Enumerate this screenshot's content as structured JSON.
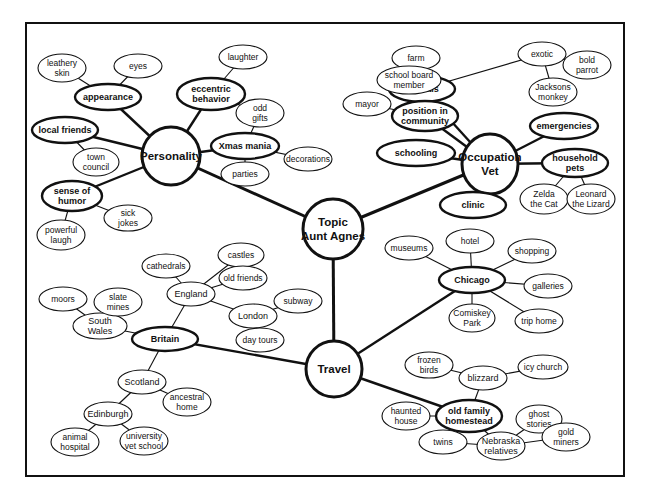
{
  "diagram": {
    "type": "mind-map",
    "center": {
      "id": "topic",
      "label": [
        "Topic",
        "Aunt Agnes"
      ]
    },
    "nodes": [
      {
        "id": "topic",
        "label": [
          "Topic",
          "Aunt Agnes"
        ],
        "level": "main"
      },
      {
        "id": "personality",
        "label": [
          "Personality"
        ],
        "level": "main"
      },
      {
        "id": "occupation",
        "label": [
          "Occupation",
          "Vet"
        ],
        "level": "main"
      },
      {
        "id": "travel",
        "label": [
          "Travel"
        ],
        "level": "main"
      },
      {
        "id": "appearance",
        "label": [
          "appearance"
        ],
        "level": "branch"
      },
      {
        "id": "leathery-skin",
        "label": [
          "leathery",
          "skin"
        ],
        "level": "leaf"
      },
      {
        "id": "eyes",
        "label": [
          "eyes"
        ],
        "level": "leaf"
      },
      {
        "id": "eccentric-behavior",
        "label": [
          "eccentric",
          "behavior"
        ],
        "level": "branch"
      },
      {
        "id": "laughter",
        "label": [
          "laughter"
        ],
        "level": "leaf"
      },
      {
        "id": "odd-gifts",
        "label": [
          "odd",
          "gifts"
        ],
        "level": "leaf"
      },
      {
        "id": "xmas-mania",
        "label": [
          "Xmas mania"
        ],
        "level": "branch"
      },
      {
        "id": "decorations",
        "label": [
          "decorations"
        ],
        "level": "leaf"
      },
      {
        "id": "parties",
        "label": [
          "parties"
        ],
        "level": "leaf"
      },
      {
        "id": "local-friends",
        "label": [
          "local friends"
        ],
        "level": "branch"
      },
      {
        "id": "town-council",
        "label": [
          "town",
          "council"
        ],
        "level": "leaf"
      },
      {
        "id": "sense-of-humor",
        "label": [
          "sense of",
          "humor"
        ],
        "level": "branch"
      },
      {
        "id": "sick-jokes",
        "label": [
          "sick",
          "jokes"
        ],
        "level": "leaf"
      },
      {
        "id": "powerful-laugh",
        "label": [
          "powerful",
          "laugh"
        ],
        "level": "leaf"
      },
      {
        "id": "animals",
        "label": [
          "animals"
        ],
        "level": "branch"
      },
      {
        "id": "farm",
        "label": [
          "farm"
        ],
        "level": "leaf"
      },
      {
        "id": "exotic",
        "label": [
          "exotic"
        ],
        "level": "leaf"
      },
      {
        "id": "bold-parrot",
        "label": [
          "bold",
          "parrot"
        ],
        "level": "leaf"
      },
      {
        "id": "jacksons-monkey",
        "label": [
          "Jacksons",
          "monkey"
        ],
        "level": "leaf"
      },
      {
        "id": "position-in-community",
        "label": [
          "position in",
          "community"
        ],
        "level": "branch"
      },
      {
        "id": "school-board-member",
        "label": [
          "school board",
          "member"
        ],
        "level": "leaf"
      },
      {
        "id": "mayor",
        "label": [
          "mayor"
        ],
        "level": "leaf"
      },
      {
        "id": "emergencies",
        "label": [
          "emergencies"
        ],
        "level": "branch"
      },
      {
        "id": "schooling",
        "label": [
          "schooling"
        ],
        "level": "branch"
      },
      {
        "id": "household-pets",
        "label": [
          "household",
          "pets"
        ],
        "level": "branch"
      },
      {
        "id": "zelda-the-cat",
        "label": [
          "Zelda",
          "the Cat"
        ],
        "level": "leaf"
      },
      {
        "id": "leonard-the-lizard",
        "label": [
          "Leonard",
          "the Lizard"
        ],
        "level": "leaf"
      },
      {
        "id": "clinic",
        "label": [
          "clinic"
        ],
        "level": "branch"
      },
      {
        "id": "chicago",
        "label": [
          "Chicago"
        ],
        "level": "branch"
      },
      {
        "id": "museums",
        "label": [
          "museums"
        ],
        "level": "leaf"
      },
      {
        "id": "hotel",
        "label": [
          "hotel"
        ],
        "level": "leaf"
      },
      {
        "id": "shopping",
        "label": [
          "shopping"
        ],
        "level": "leaf"
      },
      {
        "id": "galleries",
        "label": [
          "galleries"
        ],
        "level": "leaf"
      },
      {
        "id": "comiskey-park",
        "label": [
          "Comiskey",
          "Park"
        ],
        "level": "leaf"
      },
      {
        "id": "trip-home",
        "label": [
          "trip home"
        ],
        "level": "leaf"
      },
      {
        "id": "britain",
        "label": [
          "Britain"
        ],
        "level": "branch"
      },
      {
        "id": "england",
        "label": [
          "England"
        ],
        "level": "sub"
      },
      {
        "id": "cathedrals",
        "label": [
          "cathedrals"
        ],
        "level": "leaf"
      },
      {
        "id": "castles",
        "label": [
          "castles"
        ],
        "level": "leaf"
      },
      {
        "id": "old-friends",
        "label": [
          "old friends"
        ],
        "level": "leaf"
      },
      {
        "id": "london",
        "label": [
          "London"
        ],
        "level": "sub"
      },
      {
        "id": "subway",
        "label": [
          "subway"
        ],
        "level": "leaf"
      },
      {
        "id": "day-tours",
        "label": [
          "day tours"
        ],
        "level": "leaf"
      },
      {
        "id": "south-wales",
        "label": [
          "South",
          "Wales"
        ],
        "level": "sub"
      },
      {
        "id": "moors",
        "label": [
          "moors"
        ],
        "level": "leaf"
      },
      {
        "id": "slate-mines",
        "label": [
          "slate",
          "mines"
        ],
        "level": "leaf"
      },
      {
        "id": "scotland",
        "label": [
          "Scotland"
        ],
        "level": "sub"
      },
      {
        "id": "ancestral-home",
        "label": [
          "ancestral",
          "home"
        ],
        "level": "leaf"
      },
      {
        "id": "edinburgh",
        "label": [
          "Edinburgh"
        ],
        "level": "sub"
      },
      {
        "id": "animal-hospital",
        "label": [
          "animal",
          "hospital"
        ],
        "level": "leaf"
      },
      {
        "id": "university-vet-school",
        "label": [
          "university",
          "vet school"
        ],
        "level": "leaf"
      },
      {
        "id": "old-family-homestead",
        "label": [
          "old family",
          "homestead"
        ],
        "level": "branch"
      },
      {
        "id": "blizzard",
        "label": [
          "blizzard"
        ],
        "level": "sub"
      },
      {
        "id": "frozen-birds",
        "label": [
          "frozen",
          "birds"
        ],
        "level": "leaf"
      },
      {
        "id": "icy-church",
        "label": [
          "icy church"
        ],
        "level": "leaf"
      },
      {
        "id": "haunted-house",
        "label": [
          "haunted",
          "house"
        ],
        "level": "leaf"
      },
      {
        "id": "nebraska-relatives",
        "label": [
          "Nebraska",
          "relatives"
        ],
        "level": "sub"
      },
      {
        "id": "twins",
        "label": [
          "twins"
        ],
        "level": "leaf"
      },
      {
        "id": "ghost-stories",
        "label": [
          "ghost",
          "stories"
        ],
        "level": "leaf"
      },
      {
        "id": "gold-miners",
        "label": [
          "gold",
          "miners"
        ],
        "level": "leaf"
      }
    ],
    "edges": [
      [
        "topic",
        "personality"
      ],
      [
        "topic",
        "occupation"
      ],
      [
        "topic",
        "travel"
      ],
      [
        "personality",
        "appearance"
      ],
      [
        "appearance",
        "leathery-skin"
      ],
      [
        "appearance",
        "eyes"
      ],
      [
        "personality",
        "eccentric-behavior"
      ],
      [
        "eccentric-behavior",
        "laughter"
      ],
      [
        "eccentric-behavior",
        "odd-gifts"
      ],
      [
        "odd-gifts",
        "xmas-mania"
      ],
      [
        "personality",
        "xmas-mania"
      ],
      [
        "xmas-mania",
        "decorations"
      ],
      [
        "xmas-mania",
        "parties"
      ],
      [
        "personality",
        "local-friends"
      ],
      [
        "local-friends",
        "town-council"
      ],
      [
        "personality",
        "sense-of-humor"
      ],
      [
        "sense-of-humor",
        "sick-jokes"
      ],
      [
        "sense-of-humor",
        "powerful-laugh"
      ],
      [
        "occupation",
        "animals"
      ],
      [
        "animals",
        "farm"
      ],
      [
        "animals",
        "exotic"
      ],
      [
        "exotic",
        "bold-parrot"
      ],
      [
        "exotic",
        "jacksons-monkey"
      ],
      [
        "occupation",
        "position-in-community"
      ],
      [
        "position-in-community",
        "school-board-member"
      ],
      [
        "position-in-community",
        "mayor"
      ],
      [
        "occupation",
        "emergencies"
      ],
      [
        "occupation",
        "schooling"
      ],
      [
        "occupation",
        "household-pets"
      ],
      [
        "household-pets",
        "zelda-the-cat"
      ],
      [
        "household-pets",
        "leonard-the-lizard"
      ],
      [
        "occupation",
        "clinic"
      ],
      [
        "travel",
        "chicago"
      ],
      [
        "chicago",
        "museums"
      ],
      [
        "chicago",
        "hotel"
      ],
      [
        "chicago",
        "shopping"
      ],
      [
        "chicago",
        "galleries"
      ],
      [
        "chicago",
        "comiskey-park"
      ],
      [
        "chicago",
        "trip-home"
      ],
      [
        "travel",
        "britain"
      ],
      [
        "britain",
        "england"
      ],
      [
        "england",
        "cathedrals"
      ],
      [
        "england",
        "castles"
      ],
      [
        "england",
        "old-friends"
      ],
      [
        "england",
        "london"
      ],
      [
        "london",
        "subway"
      ],
      [
        "london",
        "day-tours"
      ],
      [
        "britain",
        "south-wales"
      ],
      [
        "south-wales",
        "moors"
      ],
      [
        "south-wales",
        "slate-mines"
      ],
      [
        "britain",
        "scotland"
      ],
      [
        "scotland",
        "ancestral-home"
      ],
      [
        "scotland",
        "edinburgh"
      ],
      [
        "edinburgh",
        "animal-hospital"
      ],
      [
        "edinburgh",
        "university-vet-school"
      ],
      [
        "travel",
        "old-family-homestead"
      ],
      [
        "old-family-homestead",
        "blizzard"
      ],
      [
        "blizzard",
        "frozen-birds"
      ],
      [
        "blizzard",
        "icy-church"
      ],
      [
        "old-family-homestead",
        "haunted-house"
      ],
      [
        "old-family-homestead",
        "nebraska-relatives"
      ],
      [
        "nebraska-relatives",
        "twins"
      ],
      [
        "nebraska-relatives",
        "ghost-stories"
      ],
      [
        "nebraska-relatives",
        "gold-miners"
      ]
    ]
  }
}
